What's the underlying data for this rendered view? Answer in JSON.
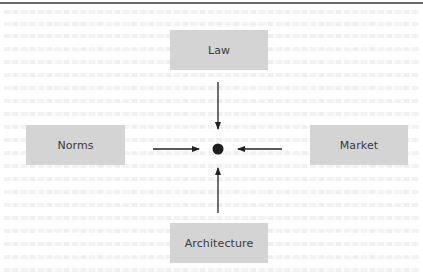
{
  "diagram": {
    "type": "four-forces-regulation-diagram",
    "nodes": [
      {
        "id": "law",
        "label": "Law",
        "position": "top"
      },
      {
        "id": "norms",
        "label": "Norms",
        "position": "left"
      },
      {
        "id": "market",
        "label": "Market",
        "position": "right"
      },
      {
        "id": "architecture",
        "label": "Architecture",
        "position": "bottom"
      }
    ],
    "center": {
      "id": "regulated-subject",
      "shape": "dot"
    },
    "edges": [
      {
        "from": "law",
        "to": "regulated-subject",
        "direction": "down"
      },
      {
        "from": "norms",
        "to": "regulated-subject",
        "direction": "right"
      },
      {
        "from": "market",
        "to": "regulated-subject",
        "direction": "left"
      },
      {
        "from": "architecture",
        "to": "regulated-subject",
        "direction": "up"
      }
    ],
    "colors": {
      "box_fill": "#d4d4d4",
      "label_text": "#3a3a3a",
      "arrow": "#222222",
      "dot": "#1e1e1e",
      "top_rule": "#6b6b6b"
    }
  }
}
